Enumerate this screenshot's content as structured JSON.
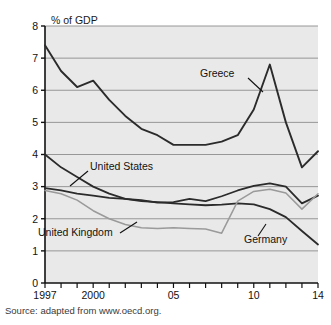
{
  "figure": {
    "cut_title": "",
    "y_unit_label": "% of GDP",
    "source_note": "Source: adapted from www.oecd.org."
  },
  "chart_data": {
    "type": "line",
    "title": "",
    "xlabel": "",
    "ylabel": "% of GDP",
    "ylim": [
      0,
      8
    ],
    "xlim": [
      1997,
      2014
    ],
    "grid": true,
    "legend": "inline-annotations",
    "ytick_labels": [
      "0",
      "1",
      "2",
      "3",
      "4",
      "5",
      "6",
      "7",
      "8"
    ],
    "ytick_values": [
      0,
      1,
      2,
      3,
      4,
      5,
      6,
      7,
      8
    ],
    "xtick_values": [
      1997,
      1998,
      1999,
      2000,
      2001,
      2002,
      2003,
      2004,
      2005,
      2006,
      2007,
      2008,
      2009,
      2010,
      2011,
      2012,
      2013,
      2014
    ],
    "xtick_labels": [
      "1997",
      "",
      "",
      "2000",
      "",
      "",
      "",
      "",
      "05",
      "",
      "",
      "",
      "",
      "10",
      "",
      "",
      "",
      "14"
    ],
    "x": [
      1997,
      1998,
      1999,
      2000,
      2001,
      2002,
      2003,
      2004,
      2005,
      2006,
      2007,
      2008,
      2009,
      2010,
      2011,
      2012,
      2013,
      2014
    ],
    "series": [
      {
        "name": "Greece",
        "color": "#2b2b2b",
        "width": 1.9,
        "values": [
          7.4,
          6.6,
          6.1,
          6.3,
          5.7,
          5.2,
          4.8,
          4.6,
          4.3,
          4.3,
          4.3,
          4.4,
          4.6,
          5.4,
          6.8,
          5.0,
          3.6,
          4.1
        ]
      },
      {
        "name": "United States",
        "color": "#2b2b2b",
        "width": 1.8,
        "values": [
          2.95,
          2.88,
          2.78,
          2.72,
          2.65,
          2.62,
          2.58,
          2.5,
          2.52,
          2.62,
          2.55,
          2.7,
          2.88,
          3.02,
          3.1,
          3.0,
          2.48,
          2.72
        ]
      },
      {
        "name": "Germany",
        "color": "#2b2b2b",
        "width": 1.8,
        "values": [
          4.0,
          3.6,
          3.3,
          3.0,
          2.78,
          2.62,
          2.55,
          2.52,
          2.48,
          2.45,
          2.42,
          2.44,
          2.48,
          2.45,
          2.3,
          2.05,
          1.62,
          1.2
        ]
      },
      {
        "name": "United Kingdom",
        "color": "#9a9a9a",
        "width": 1.5,
        "values": [
          2.88,
          2.78,
          2.58,
          2.25,
          2.0,
          1.82,
          1.72,
          1.7,
          1.72,
          1.7,
          1.68,
          1.55,
          2.55,
          2.85,
          2.92,
          2.8,
          2.3,
          2.78
        ]
      }
    ],
    "annotations": [
      {
        "name": "Greece",
        "text": "Greece",
        "x_px": 200,
        "y_px": 77,
        "leader": "M248,78 L263,92"
      },
      {
        "name": "United States",
        "text": "United States",
        "x_px": 90,
        "y_px": 170,
        "leader": "M88,171 L70,186"
      },
      {
        "name": "United Kingdom",
        "text": "United Kingdom",
        "x_px": 38,
        "y_px": 236,
        "leader": "M120,233 L137,222"
      },
      {
        "name": "Germany",
        "text": "Germany",
        "x_px": 244,
        "y_px": 243,
        "leader": "M258,236 L266,224"
      }
    ]
  }
}
